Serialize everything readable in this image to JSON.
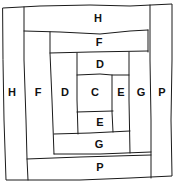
{
  "line_color": "#1a1a1a",
  "pieces": [
    {
      "id": "H-left",
      "label": "H",
      "x": 12,
      "y": 92
    },
    {
      "id": "H-top",
      "label": "H",
      "x": 98,
      "y": 18
    },
    {
      "id": "F-left",
      "label": "F",
      "x": 38,
      "y": 92
    },
    {
      "id": "F-top",
      "label": "F",
      "x": 99,
      "y": 42
    },
    {
      "id": "D-left",
      "label": "D",
      "x": 65,
      "y": 92
    },
    {
      "id": "D-top",
      "label": "D",
      "x": 100,
      "y": 64
    },
    {
      "id": "C-center",
      "label": "C",
      "x": 95,
      "y": 92
    },
    {
      "id": "E-right",
      "label": "E",
      "x": 121,
      "y": 92
    },
    {
      "id": "E-bottom",
      "label": "E",
      "x": 100,
      "y": 122
    },
    {
      "id": "G-right",
      "label": "G",
      "x": 141,
      "y": 92
    },
    {
      "id": "G-bottom",
      "label": "G",
      "x": 99,
      "y": 144
    },
    {
      "id": "P-right",
      "label": "P",
      "x": 162,
      "y": 92
    },
    {
      "id": "P-bottom",
      "label": "P",
      "x": 100,
      "y": 167
    }
  ]
}
